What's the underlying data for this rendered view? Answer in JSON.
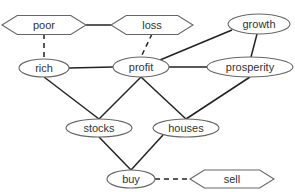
{
  "diagram": {
    "caption": "",
    "nodes": [
      {
        "id": "poor",
        "label": "poor",
        "shape": "hexagon",
        "cx": 44,
        "cy": 25,
        "w": 84,
        "h": 19
      },
      {
        "id": "loss",
        "label": "loss",
        "shape": "hexagon",
        "cx": 152,
        "cy": 25,
        "w": 82,
        "h": 19
      },
      {
        "id": "growth",
        "label": "growth",
        "shape": "ellipse",
        "cx": 259,
        "cy": 24,
        "rx": 31,
        "ry": 10
      },
      {
        "id": "rich",
        "label": "rich",
        "shape": "ellipse",
        "cx": 44,
        "cy": 68,
        "rx": 25,
        "ry": 9
      },
      {
        "id": "profit",
        "label": "profit",
        "shape": "ellipse",
        "cx": 141,
        "cy": 67,
        "rx": 28,
        "ry": 10
      },
      {
        "id": "prosperity",
        "label": "prosperity",
        "shape": "ellipse",
        "cx": 250,
        "cy": 67,
        "rx": 43,
        "ry": 10
      },
      {
        "id": "stocks",
        "label": "stocks",
        "shape": "ellipse",
        "cx": 99,
        "cy": 128,
        "rx": 33,
        "ry": 9
      },
      {
        "id": "houses",
        "label": "houses",
        "shape": "ellipse",
        "cx": 186,
        "cy": 128,
        "rx": 33,
        "ry": 9
      },
      {
        "id": "buy",
        "label": "buy",
        "shape": "ellipse",
        "cx": 131,
        "cy": 179,
        "rx": 24,
        "ry": 9
      },
      {
        "id": "sell",
        "label": "sell",
        "shape": "hexagon",
        "cx": 232,
        "cy": 179,
        "w": 84,
        "h": 18
      }
    ],
    "edges": [
      {
        "from": "poor",
        "to": "loss",
        "style": "solid",
        "x1": 86,
        "y1": 25,
        "x2": 111,
        "y2": 25
      },
      {
        "from": "poor",
        "to": "rich",
        "style": "dashed",
        "x1": 44,
        "y1": 34,
        "x2": 44,
        "y2": 59
      },
      {
        "from": "loss",
        "to": "profit",
        "style": "dashed",
        "x1": 152,
        "y1": 34,
        "x2": 141,
        "y2": 57
      },
      {
        "from": "growth",
        "to": "profit",
        "style": "solid",
        "x1": 232,
        "y1": 30,
        "x2": 160,
        "y2": 60
      },
      {
        "from": "growth",
        "to": "prosperity",
        "style": "solid",
        "x1": 257,
        "y1": 34,
        "x2": 251,
        "y2": 57
      },
      {
        "from": "rich",
        "to": "profit",
        "style": "solid",
        "x1": 69,
        "y1": 68,
        "x2": 113,
        "y2": 67
      },
      {
        "from": "profit",
        "to": "prosperity",
        "style": "solid",
        "x1": 169,
        "y1": 67,
        "x2": 207,
        "y2": 67
      },
      {
        "from": "rich",
        "to": "stocks",
        "style": "solid",
        "x1": 44,
        "y1": 77,
        "x2": 99,
        "y2": 119
      },
      {
        "from": "profit",
        "to": "stocks",
        "style": "solid",
        "x1": 141,
        "y1": 77,
        "x2": 99,
        "y2": 119
      },
      {
        "from": "profit",
        "to": "houses",
        "style": "solid",
        "x1": 141,
        "y1": 77,
        "x2": 186,
        "y2": 119
      },
      {
        "from": "prosperity",
        "to": "houses",
        "style": "solid",
        "x1": 250,
        "y1": 77,
        "x2": 186,
        "y2": 119
      },
      {
        "from": "stocks",
        "to": "buy",
        "style": "solid",
        "x1": 99,
        "y1": 137,
        "x2": 131,
        "y2": 170
      },
      {
        "from": "houses",
        "to": "buy",
        "style": "solid",
        "x1": 163,
        "y1": 135,
        "x2": 131,
        "y2": 170
      },
      {
        "from": "buy",
        "to": "sell",
        "style": "dashed",
        "x1": 155,
        "y1": 179,
        "x2": 190,
        "y2": 179
      }
    ]
  }
}
